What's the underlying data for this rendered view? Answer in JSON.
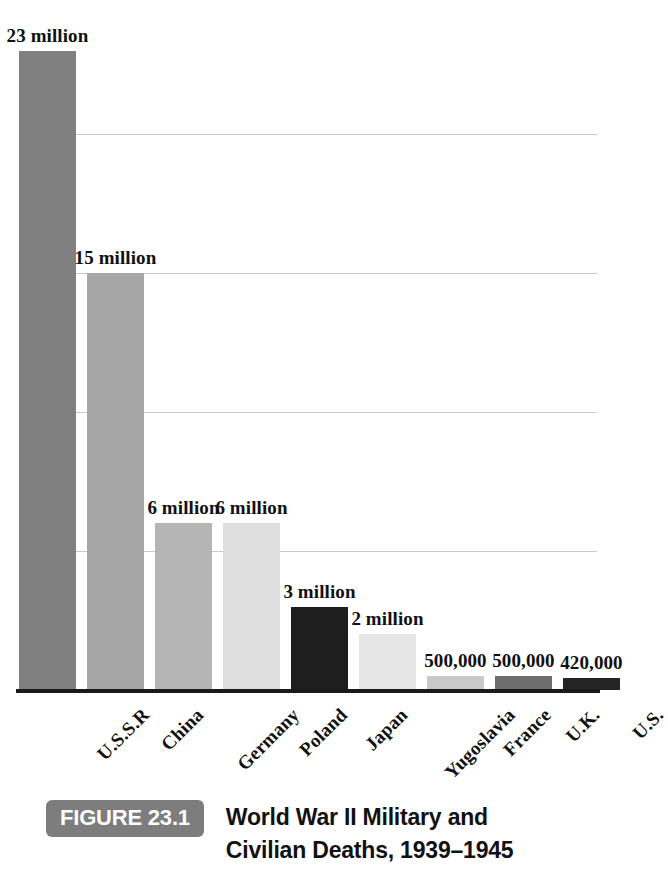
{
  "chart_data": {
    "type": "bar",
    "title": "World War II Military and Civilian Deaths, 1939–1945",
    "figure_number": "FIGURE 23.1",
    "xlabel": "",
    "ylabel": "",
    "ylim": [
      0,
      25
    ],
    "grid": true,
    "grid_values": [
      5,
      10,
      15,
      20
    ],
    "legend": "none",
    "units": "deaths",
    "categories": [
      "U.S.S.R",
      "China",
      "Germany",
      "Poland",
      "Japan",
      "Yugoslavia",
      "France",
      "U.K.",
      "U.S."
    ],
    "values": [
      23000000,
      15000000,
      6000000,
      6000000,
      3000000,
      2000000,
      500000,
      500000,
      420000
    ],
    "value_labels": [
      "23 million",
      "15 million",
      "6 million",
      "6 million",
      "3 million",
      "2 million",
      "500,000",
      "500,000",
      "420,000"
    ],
    "bar_colors": [
      "#808080",
      "#a6a6a6",
      "#b5b5b5",
      "#dedede",
      "#1e1e1e",
      "#e6e6e6",
      "#c9c9c9",
      "#6e6e6e",
      "#242424"
    ]
  },
  "caption": {
    "badge": "FIGURE 23.1",
    "line1": "World War II Military and",
    "line2": "Civilian Deaths, 1939–1945"
  }
}
